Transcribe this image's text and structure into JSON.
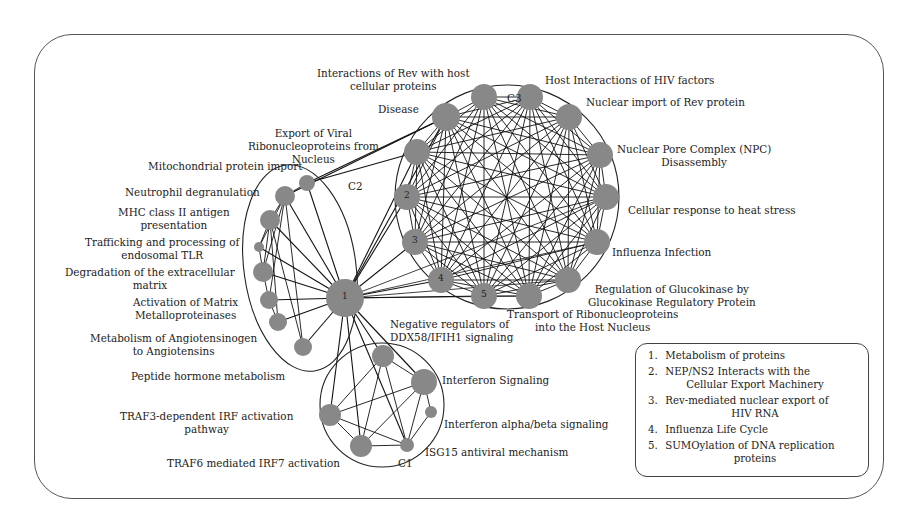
{
  "figure": {
    "type": "network-diagram",
    "node_color": "#888888",
    "edge_color": "#111111"
  },
  "clusters": {
    "c1": {
      "label": "C1"
    },
    "c2": {
      "label": "C2"
    },
    "c3": {
      "label": "C3"
    }
  },
  "labels": {
    "interactions_rev": [
      "Interactions of Rev with host",
      "cellular proteins"
    ],
    "host_interactions": "Host Interactions of HIV factors",
    "disease": "Disease",
    "nuclear_import": "Nuclear import of Rev protein",
    "npc": [
      "Nuclear Pore Complex (NPC)",
      "Disassembly"
    ],
    "heat_stress": "Cellular response to heat stress",
    "influenza_infection": "Influenza Infection",
    "glucokinase": [
      "Regulation of Glucokinase by",
      "Glucokinase Regulatory Protein"
    ],
    "transport_rnp": [
      "Transport of Ribonucleoproteins",
      "into the Host Nucleus"
    ],
    "export_viral": [
      "Export of Viral",
      "Ribonucleoproteins from",
      "Nucleus"
    ],
    "mito": "Mitochondrial protein import",
    "neutrophil": "Neutrophil degranulation",
    "mhc": [
      "MHC class II antigen",
      "presentation"
    ],
    "trafficking": [
      "Trafficking and processing of",
      "endosomal TLR"
    ],
    "degradation": [
      "Degradation of the extracellular",
      "matrix"
    ],
    "activation_mmp": [
      "Activation of Matrix",
      "Metalloproteinases"
    ],
    "angiotensin": [
      "Metabolism of Angiotensinogen",
      "to Angiotensins"
    ],
    "peptide_hormone": "Peptide hormone metabolism",
    "negative_regulators": [
      "Negative regulators of",
      "DDX58/IFIH1 signaling"
    ],
    "interferon_signaling": "Interferon Signaling",
    "interferon_alpha": "Interferon alpha/beta signaling",
    "isg15": "ISG15 antiviral mechanism",
    "traf3": [
      "TRAF3-dependent IRF activation",
      "pathway"
    ],
    "traf6": "TRAF6 mediated IRF7 activation"
  },
  "node_numbers": [
    "1",
    "2",
    "3",
    "4",
    "5"
  ],
  "legend": {
    "items": [
      {
        "num": "1.",
        "text": "Metabolism of proteins",
        "cont": ""
      },
      {
        "num": "2.",
        "text": "NEP/NS2 Interacts with the",
        "cont": "Cellular Export Machinery"
      },
      {
        "num": "3.",
        "text": "Rev-mediated nuclear export of",
        "cont": "HIV RNA"
      },
      {
        "num": "4.",
        "text": "Influenza Life Cycle",
        "cont": ""
      },
      {
        "num": "5.",
        "text": "SUMOylation of DNA replication",
        "cont": "proteins"
      }
    ]
  }
}
